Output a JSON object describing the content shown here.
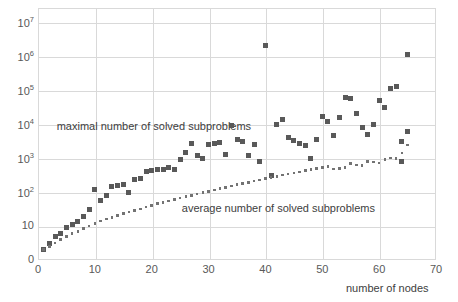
{
  "chart_data": {
    "type": "scatter",
    "title": "",
    "xlabel": "number of nodes",
    "ylabel": "",
    "xlim": [
      0,
      70
    ],
    "ylim_log": [
      1,
      10000000
    ],
    "yscale": "log",
    "grid": true,
    "legend_position": "inline-annotations",
    "x_ticks": [
      "0",
      "10",
      "20",
      "30",
      "40",
      "50",
      "60",
      "70"
    ],
    "x_tick_values": [
      0,
      10,
      20,
      30,
      40,
      50,
      60,
      70
    ],
    "y_ticks": [
      "0",
      "10",
      "10^2",
      "10^3",
      "10^4",
      "10^5",
      "10^6",
      "10^7"
    ],
    "y_tick_values": [
      1,
      10,
      100,
      1000,
      10000,
      100000,
      1000000,
      10000000
    ],
    "annotations": [
      {
        "text": "maximal number of solved subproblems",
        "x": 20,
        "y": 9000
      },
      {
        "text": "average number of solved subproblems",
        "x": 42,
        "y": 33
      }
    ],
    "series": [
      {
        "name": "maximal number of solved subproblems",
        "marker": "square",
        "color": "#595959",
        "points": [
          [
            1,
            2
          ],
          [
            2,
            3
          ],
          [
            3,
            5
          ],
          [
            4,
            6
          ],
          [
            5,
            9
          ],
          [
            6,
            11
          ],
          [
            7,
            14
          ],
          [
            8,
            19
          ],
          [
            9,
            30
          ],
          [
            10,
            120
          ],
          [
            11,
            55
          ],
          [
            12,
            80
          ],
          [
            13,
            150
          ],
          [
            14,
            160
          ],
          [
            15,
            170
          ],
          [
            16,
            95
          ],
          [
            17,
            230
          ],
          [
            18,
            250
          ],
          [
            19,
            400
          ],
          [
            20,
            430
          ],
          [
            21,
            450
          ],
          [
            22,
            470
          ],
          [
            23,
            520
          ],
          [
            24,
            470
          ],
          [
            25,
            900
          ],
          [
            26,
            1500
          ],
          [
            27,
            2600
          ],
          [
            28,
            1200
          ],
          [
            29,
            950
          ],
          [
            30,
            2500
          ],
          [
            31,
            2600
          ],
          [
            32,
            2900
          ],
          [
            33,
            1300
          ],
          [
            34,
            9000
          ],
          [
            35,
            3400
          ],
          [
            36,
            3000
          ],
          [
            37,
            1200
          ],
          [
            38,
            2500
          ],
          [
            39,
            800
          ],
          [
            40,
            2000000
          ],
          [
            41,
            300
          ],
          [
            42,
            9500
          ],
          [
            43,
            14000
          ],
          [
            44,
            4000
          ],
          [
            45,
            3200
          ],
          [
            46,
            2600
          ],
          [
            47,
            2400
          ],
          [
            48,
            1000
          ],
          [
            49,
            3500
          ],
          [
            50,
            17000
          ],
          [
            51,
            12000
          ],
          [
            52,
            4500
          ],
          [
            53,
            16000
          ],
          [
            54,
            60000
          ],
          [
            55,
            55000
          ],
          [
            56,
            20000
          ],
          [
            57,
            8000
          ],
          [
            58,
            5000
          ],
          [
            59,
            10000
          ],
          [
            60,
            50000
          ],
          [
            61,
            30000
          ],
          [
            62,
            110000
          ],
          [
            63,
            130000
          ],
          [
            64,
            3000
          ],
          [
            64,
            800
          ],
          [
            65,
            1100000
          ],
          [
            65,
            6000
          ]
        ]
      },
      {
        "name": "average number of solved subproblems",
        "marker": "small-square",
        "color": "#737373",
        "points": [
          [
            1,
            2
          ],
          [
            2,
            2.5
          ],
          [
            3,
            3.2
          ],
          [
            4,
            4
          ],
          [
            5,
            5
          ],
          [
            6,
            6
          ],
          [
            7,
            7
          ],
          [
            8,
            8.5
          ],
          [
            9,
            10
          ],
          [
            10,
            12
          ],
          [
            11,
            14
          ],
          [
            12,
            16
          ],
          [
            13,
            18
          ],
          [
            14,
            20
          ],
          [
            15,
            23
          ],
          [
            16,
            26
          ],
          [
            17,
            29
          ],
          [
            18,
            32
          ],
          [
            19,
            36
          ],
          [
            20,
            40
          ],
          [
            21,
            45
          ],
          [
            22,
            50
          ],
          [
            23,
            55
          ],
          [
            24,
            60
          ],
          [
            25,
            66
          ],
          [
            26,
            73
          ],
          [
            27,
            80
          ],
          [
            28,
            88
          ],
          [
            29,
            96
          ],
          [
            30,
            105
          ],
          [
            31,
            115
          ],
          [
            32,
            125
          ],
          [
            33,
            137
          ],
          [
            34,
            150
          ],
          [
            35,
            163
          ],
          [
            36,
            178
          ],
          [
            37,
            193
          ],
          [
            38,
            210
          ],
          [
            39,
            228
          ],
          [
            40,
            247
          ],
          [
            41,
            268
          ],
          [
            42,
            290
          ],
          [
            43,
            313
          ],
          [
            44,
            338
          ],
          [
            45,
            364
          ],
          [
            46,
            392
          ],
          [
            47,
            421
          ],
          [
            48,
            452
          ],
          [
            49,
            485
          ],
          [
            50,
            520
          ],
          [
            51,
            556
          ],
          [
            52,
            470
          ],
          [
            53,
            500
          ],
          [
            54,
            530
          ],
          [
            55,
            700
          ],
          [
            56,
            620
          ],
          [
            57,
            600
          ],
          [
            58,
            800
          ],
          [
            59,
            760
          ],
          [
            60,
            720
          ],
          [
            61,
            900
          ],
          [
            62,
            1000
          ],
          [
            63,
            950
          ],
          [
            64,
            1400
          ],
          [
            65,
            2400
          ]
        ]
      }
    ]
  },
  "axis": {
    "x_label": "number of nodes"
  }
}
